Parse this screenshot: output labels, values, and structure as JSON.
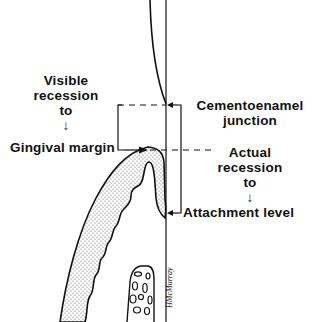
{
  "diagram": {
    "colors": {
      "line": "#111111",
      "stipple": "#555555",
      "background": "#ffffff"
    },
    "labels": {
      "visible_recession": {
        "line1": "Visible",
        "line2": "recession",
        "line3": "to",
        "arrow": "↓"
      },
      "gingival_margin": "Gingival margin",
      "cej": {
        "line1": "Cementoenamel",
        "line2": "junction"
      },
      "actual_recession": {
        "line1": "Actual",
        "line2": "recession",
        "line3": "to",
        "arrow": "↓"
      },
      "attachment_level": "Attachment level"
    },
    "reference_lines": {
      "cementoenamel_junction_y": 105,
      "gingival_margin_y": 150,
      "attachment_level_y": 213,
      "tooth_surface_x": 166
    },
    "signature": "HMcMurray"
  }
}
